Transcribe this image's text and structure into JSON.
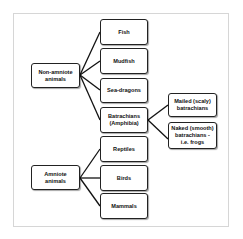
{
  "diagram": {
    "type": "tree",
    "roots": [
      {
        "id": "non-amniote",
        "label": "Non-amniote animals",
        "children": [
          {
            "id": "fish",
            "label": "Fish"
          },
          {
            "id": "mudfish",
            "label": "Mudfish"
          },
          {
            "id": "sea-dragons",
            "label": "Sea-dragons"
          },
          {
            "id": "batrachians",
            "label": "Batrachians (Amphibia)",
            "children": [
              {
                "id": "mailed",
                "label": "Mailed (scaly) batrachians"
              },
              {
                "id": "naked",
                "label": "Naked (smooth) batrachians - i.e. frogs"
              }
            ]
          }
        ]
      },
      {
        "id": "amniote",
        "label": "Amniote animals",
        "children": [
          {
            "id": "reptiles",
            "label": "Reptiles"
          },
          {
            "id": "birds",
            "label": "Birds"
          },
          {
            "id": "mammals",
            "label": "Mammals"
          }
        ]
      }
    ]
  },
  "nodes": {
    "non_amniote": "Non-amniote animals",
    "amniote": "Amniote animals",
    "fish": "Fish",
    "mudfish": "Mudfish",
    "sea_dragons": "Sea-dragons",
    "batrachians": "Batrachians (Amphibia)",
    "mailed": "Mailed (scaly) batrachians",
    "naked": "Naked (smooth) batrachians - i.e. frogs",
    "reptiles": "Reptiles",
    "birds": "Birds",
    "mammals": "Mammals"
  },
  "colors": {
    "line": "#111111",
    "border": "#222222",
    "frame": "#d6d6d6"
  }
}
